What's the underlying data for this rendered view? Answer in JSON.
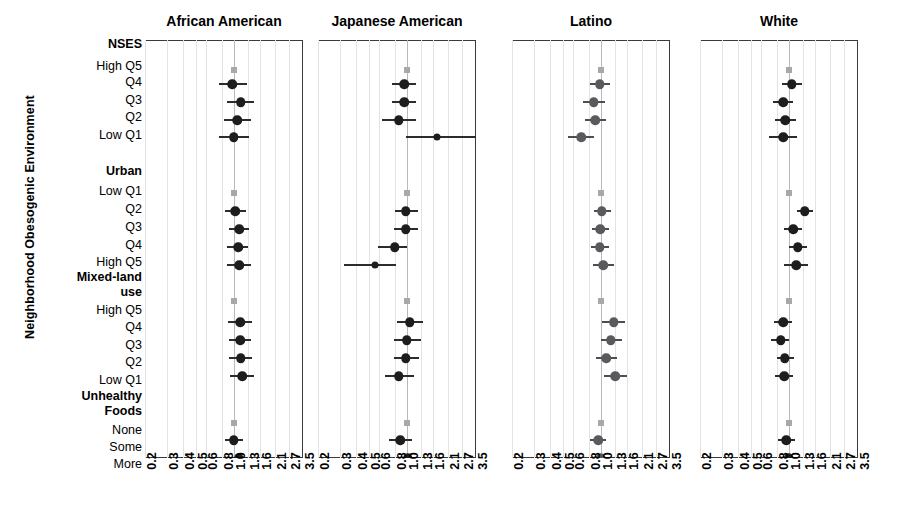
{
  "axis_title_y": "Neighborhood Obesogenic Environment",
  "x_ticks": [
    "0.2",
    "0.3",
    "0.4",
    "0.5",
    "0.6",
    "0.8",
    "1.0",
    "1.3",
    "1.6",
    "2.1",
    "2.7",
    "3.5"
  ],
  "row_labels": [
    {
      "text": "NSES",
      "header": true
    },
    {
      "text": "High Q5",
      "header": false
    },
    {
      "text": "Q4",
      "header": false
    },
    {
      "text": "Q3",
      "header": false
    },
    {
      "text": "Q2",
      "header": false
    },
    {
      "text": "Low Q1",
      "header": false
    },
    {
      "text": "Urban",
      "header": true
    },
    {
      "text": "Low Q1",
      "header": false
    },
    {
      "text": "Q2",
      "header": false
    },
    {
      "text": "Q3",
      "header": false
    },
    {
      "text": "Q4",
      "header": false
    },
    {
      "text": "High Q5",
      "header": false
    },
    {
      "text": "Mixed-land",
      "header": true
    },
    {
      "text": "use",
      "header": true
    },
    {
      "text": "High Q5",
      "header": false
    },
    {
      "text": "Q4",
      "header": false
    },
    {
      "text": "Q3",
      "header": false
    },
    {
      "text": "Q2",
      "header": false
    },
    {
      "text": "Low Q1",
      "header": false
    },
    {
      "text": "Unhealthy",
      "header": true
    },
    {
      "text": "Foods",
      "header": true
    },
    {
      "text": "None",
      "header": false
    },
    {
      "text": "Some",
      "header": false
    },
    {
      "text": "More",
      "header": false
    }
  ],
  "panel_titles": [
    "African American",
    "Japanese American",
    "Latino",
    "White"
  ],
  "chart_data": {
    "type": "scatter",
    "subtype": "forest-plot",
    "title": "",
    "xlabel": "",
    "ylabel": "Neighborhood Obesogenic Environment",
    "xscale": "log",
    "xlim": [
      0.2,
      3.5
    ],
    "xticks": [
      0.2,
      0.3,
      0.4,
      0.5,
      0.6,
      0.8,
      1.0,
      1.3,
      1.6,
      2.1,
      2.7,
      3.5
    ],
    "grid": true,
    "reference_line": 1.0,
    "legend": "none",
    "categories": [
      "NSES High Q5",
      "NSES Q4",
      "NSES Q3",
      "NSES Q2",
      "NSES Low Q1",
      "Urban Low Q1",
      "Urban Q2",
      "Urban Q3",
      "Urban Q4",
      "Urban High Q5",
      "Mixed-land use High Q5",
      "Mixed-land use Q4",
      "Mixed-land use Q3",
      "Mixed-land use Q2",
      "Mixed-land use Low Q1",
      "Unhealthy Foods None",
      "Unhealthy Foods Some",
      "Unhealthy Foods More"
    ],
    "series": [
      {
        "name": "African American",
        "color": "#1d1d1d",
        "points": [
          {
            "category": "NSES High Q5",
            "estimate": 1.0,
            "low": 1.0,
            "high": 1.0,
            "reference": true
          },
          {
            "category": "NSES Q4",
            "estimate": 0.97,
            "low": 0.76,
            "high": 1.26
          },
          {
            "category": "NSES Q3",
            "estimate": 1.13,
            "low": 0.88,
            "high": 1.45
          },
          {
            "category": "NSES Q2",
            "estimate": 1.06,
            "low": 0.83,
            "high": 1.36
          },
          {
            "category": "NSES Low Q1",
            "estimate": 1.0,
            "low": 0.77,
            "high": 1.31
          },
          {
            "category": "Urban Low Q1",
            "estimate": 1.0,
            "low": 1.0,
            "high": 1.0,
            "reference": true
          },
          {
            "category": "Urban Q2",
            "estimate": 1.03,
            "low": 0.85,
            "high": 1.25
          },
          {
            "category": "Urban Q3",
            "estimate": 1.1,
            "low": 0.92,
            "high": 1.32
          },
          {
            "category": "Urban Q4",
            "estimate": 1.08,
            "low": 0.89,
            "high": 1.3
          },
          {
            "category": "Urban High Q5",
            "estimate": 1.1,
            "low": 0.88,
            "high": 1.37
          },
          {
            "category": "Mixed-land use High Q5",
            "estimate": 1.0,
            "low": 1.0,
            "high": 1.0,
            "reference": true
          },
          {
            "category": "Mixed-land use Q4",
            "estimate": 1.12,
            "low": 0.9,
            "high": 1.4
          },
          {
            "category": "Mixed-land use Q3",
            "estimate": 1.12,
            "low": 0.92,
            "high": 1.36
          },
          {
            "category": "Mixed-land use Q2",
            "estimate": 1.13,
            "low": 0.92,
            "high": 1.38
          },
          {
            "category": "Mixed-land use Low Q1",
            "estimate": 1.16,
            "low": 0.93,
            "high": 1.44
          },
          {
            "category": "Unhealthy Foods None",
            "estimate": 1.0,
            "low": 1.0,
            "high": 1.0,
            "reference": true
          },
          {
            "category": "Unhealthy Foods Some",
            "estimate": 1.0,
            "low": 0.85,
            "high": 1.18
          },
          {
            "category": "Unhealthy Foods More",
            "estimate": 1.09,
            "low": 0.94,
            "high": 1.27
          }
        ]
      },
      {
        "name": "Japanese American",
        "color": "#1d1d1d",
        "points": [
          {
            "category": "NSES High Q5",
            "estimate": 1.0,
            "low": 1.0,
            "high": 1.0,
            "reference": true
          },
          {
            "category": "NSES Q4",
            "estimate": 0.95,
            "low": 0.77,
            "high": 1.18
          },
          {
            "category": "NSES Q3",
            "estimate": 0.95,
            "low": 0.77,
            "high": 1.18
          },
          {
            "category": "NSES Q2",
            "estimate": 0.86,
            "low": 0.64,
            "high": 1.18
          },
          {
            "category": "NSES Low Q1",
            "estimate": 1.73,
            "low": 0.98,
            "high": 3.6
          },
          {
            "category": "Urban Low Q1",
            "estimate": 1.0,
            "low": 1.0,
            "high": 1.0,
            "reference": true
          },
          {
            "category": "Urban Q2",
            "estimate": 0.98,
            "low": 0.81,
            "high": 1.22
          },
          {
            "category": "Urban Q3",
            "estimate": 0.98,
            "low": 0.79,
            "high": 1.22
          },
          {
            "category": "Urban Q4",
            "estimate": 0.8,
            "low": 0.59,
            "high": 1.0
          },
          {
            "category": "Urban High Q5",
            "estimate": 0.56,
            "low": 0.32,
            "high": 0.82
          },
          {
            "category": "Mixed-land use High Q5",
            "estimate": 1.0,
            "low": 1.0,
            "high": 1.0,
            "reference": true
          },
          {
            "category": "Mixed-land use Q4",
            "estimate": 1.05,
            "low": 0.83,
            "high": 1.35
          },
          {
            "category": "Mixed-land use Q3",
            "estimate": 1.0,
            "low": 0.79,
            "high": 1.29
          },
          {
            "category": "Mixed-land use Q2",
            "estimate": 0.98,
            "low": 0.79,
            "high": 1.24
          },
          {
            "category": "Mixed-land use Low Q1",
            "estimate": 0.86,
            "low": 0.67,
            "high": 1.13
          },
          {
            "category": "Unhealthy Foods None",
            "estimate": 1.0,
            "low": 1.0,
            "high": 1.0,
            "reference": true
          },
          {
            "category": "Unhealthy Foods Some",
            "estimate": 0.89,
            "low": 0.73,
            "high": 1.1
          },
          {
            "category": "Unhealthy Foods More",
            "estimate": 1.02,
            "low": 0.85,
            "high": 1.24
          }
        ]
      },
      {
        "name": "Latino",
        "color": "#5a5a5e",
        "points": [
          {
            "category": "NSES High Q5",
            "estimate": 1.0,
            "low": 1.0,
            "high": 1.0,
            "reference": true
          },
          {
            "category": "NSES Q4",
            "estimate": 0.98,
            "low": 0.82,
            "high": 1.18
          },
          {
            "category": "NSES Q3",
            "estimate": 0.88,
            "low": 0.72,
            "high": 1.07
          },
          {
            "category": "NSES Q2",
            "estimate": 0.9,
            "low": 0.75,
            "high": 1.09
          },
          {
            "category": "NSES Low Q1",
            "estimate": 0.7,
            "low": 0.55,
            "high": 0.88
          },
          {
            "category": "Urban Low Q1",
            "estimate": 1.0,
            "low": 1.0,
            "high": 1.0,
            "reference": true
          },
          {
            "category": "Urban Q2",
            "estimate": 1.02,
            "low": 0.88,
            "high": 1.2
          },
          {
            "category": "Urban Q3",
            "estimate": 0.99,
            "low": 0.85,
            "high": 1.16
          },
          {
            "category": "Urban Q4",
            "estimate": 0.98,
            "low": 0.83,
            "high": 1.15
          },
          {
            "category": "Urban High Q5",
            "estimate": 1.04,
            "low": 0.87,
            "high": 1.28
          },
          {
            "category": "Mixed-land use High Q5",
            "estimate": 1.0,
            "low": 1.0,
            "high": 1.0,
            "reference": true
          },
          {
            "category": "Mixed-land use Q4",
            "estimate": 1.26,
            "low": 1.03,
            "high": 1.55
          },
          {
            "category": "Mixed-land use Q3",
            "estimate": 1.2,
            "low": 1.0,
            "high": 1.46
          },
          {
            "category": "Mixed-land use Q2",
            "estimate": 1.1,
            "low": 0.91,
            "high": 1.34
          },
          {
            "category": "Mixed-land use Low Q1",
            "estimate": 1.3,
            "low": 1.06,
            "high": 1.62
          },
          {
            "category": "Unhealthy Foods None",
            "estimate": 1.0,
            "low": 1.0,
            "high": 1.0,
            "reference": true
          },
          {
            "category": "Unhealthy Foods Some",
            "estimate": 0.95,
            "low": 0.82,
            "high": 1.1
          },
          {
            "category": "Unhealthy Foods More",
            "estimate": 1.0,
            "low": 0.88,
            "high": 1.15
          }
        ]
      },
      {
        "name": "White",
        "color": "#1d1d1d",
        "points": [
          {
            "category": "NSES High Q5",
            "estimate": 1.0,
            "low": 1.0,
            "high": 1.0,
            "reference": true
          },
          {
            "category": "NSES Q4",
            "estimate": 1.05,
            "low": 0.88,
            "high": 1.26
          },
          {
            "category": "NSES Q3",
            "estimate": 0.9,
            "low": 0.75,
            "high": 1.08
          },
          {
            "category": "NSES Q2",
            "estimate": 0.94,
            "low": 0.78,
            "high": 1.14
          },
          {
            "category": "NSES Low Q1",
            "estimate": 0.9,
            "low": 0.7,
            "high": 1.15
          },
          {
            "category": "Urban Low Q1",
            "estimate": 1.0,
            "low": 1.0,
            "high": 1.0,
            "reference": true
          },
          {
            "category": "Urban Q2",
            "estimate": 1.33,
            "low": 1.15,
            "high": 1.55
          },
          {
            "category": "Urban Q3",
            "estimate": 1.08,
            "low": 0.92,
            "high": 1.28
          },
          {
            "category": "Urban Q4",
            "estimate": 1.18,
            "low": 1.0,
            "high": 1.4
          },
          {
            "category": "Urban High Q5",
            "estimate": 1.14,
            "low": 0.92,
            "high": 1.42
          },
          {
            "category": "Mixed-land use High Q5",
            "estimate": 1.0,
            "low": 1.0,
            "high": 1.0,
            "reference": true
          },
          {
            "category": "Mixed-land use Q4",
            "estimate": 0.9,
            "low": 0.77,
            "high": 1.06
          },
          {
            "category": "Mixed-land use Q3",
            "estimate": 0.86,
            "low": 0.73,
            "high": 1.01
          },
          {
            "category": "Mixed-land use Q2",
            "estimate": 0.93,
            "low": 0.8,
            "high": 1.09
          },
          {
            "category": "Mixed-land use Low Q1",
            "estimate": 0.92,
            "low": 0.78,
            "high": 1.08
          },
          {
            "category": "Unhealthy Foods None",
            "estimate": 1.0,
            "low": 1.0,
            "high": 1.0,
            "reference": true
          },
          {
            "category": "Unhealthy Foods Some",
            "estimate": 0.95,
            "low": 0.82,
            "high": 1.11
          },
          {
            "category": "Unhealthy Foods More",
            "estimate": 1.0,
            "low": 0.88,
            "high": 1.15
          }
        ]
      }
    ]
  }
}
